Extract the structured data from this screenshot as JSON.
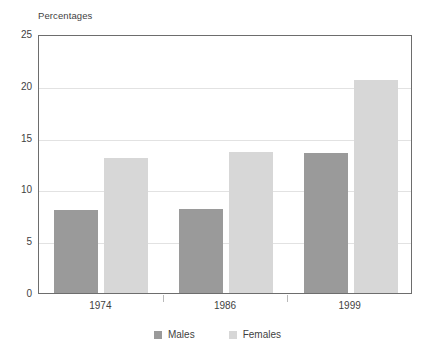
{
  "chart_data": {
    "type": "bar",
    "title": "Percentages",
    "xlabel": "",
    "ylabel": "Percentages",
    "categories": [
      "1974",
      "1986",
      "1999"
    ],
    "series": [
      {
        "name": "Males",
        "color": "#9a9a9a",
        "values": [
          8.0,
          8.1,
          13.5
        ]
      },
      {
        "name": "Females",
        "color": "#d7d7d7",
        "values": [
          13.0,
          13.6,
          20.6
        ]
      }
    ],
    "ylim": [
      0,
      25
    ],
    "yticks": [
      0,
      5,
      10,
      15,
      20,
      25
    ],
    "ytick_labels": [
      "0",
      "5",
      "10",
      "15",
      "20",
      "25"
    ],
    "grid": true,
    "grid_axis": "y",
    "legend_position": "bottom-center",
    "background": "#ffffff",
    "axis_color": "#6d6d6d",
    "gridline_color": "#e2e2e2"
  },
  "legend": {
    "items": [
      {
        "label": "Males",
        "color": "#9a9a9a"
      },
      {
        "label": "Females",
        "color": "#d7d7d7"
      }
    ]
  }
}
